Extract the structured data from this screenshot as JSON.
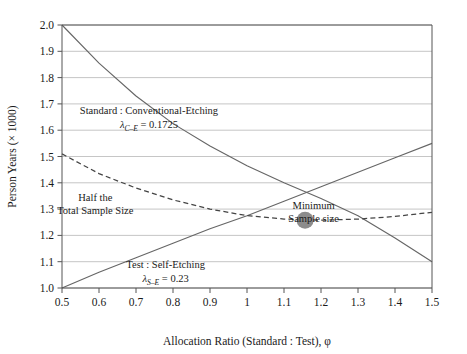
{
  "chart_data": {
    "type": "line",
    "title": "",
    "xlabel": "Allocation Ratio (Standard : Test), φ",
    "ylabel": "Person Years (× 1000)",
    "xlim": [
      0.5,
      1.5
    ],
    "ylim": [
      1.0,
      2.0
    ],
    "grid": true,
    "legend": "none (inline annotations)",
    "xticks": [
      "0.5",
      "0.6",
      "0.7",
      "0.8",
      "0.9",
      "1",
      "1.1",
      "1.2",
      "1.3",
      "1.4",
      "1.5"
    ],
    "yticks": [
      "1.0",
      "1.1",
      "1.2",
      "1.3",
      "1.4",
      "1.5",
      "1.6",
      "1.7",
      "1.8",
      "1.9",
      "2.0"
    ],
    "x": [
      0.5,
      0.6,
      0.7,
      0.8,
      0.9,
      1.0,
      1.1,
      1.2,
      1.3,
      1.4,
      1.5
    ],
    "series": [
      {
        "name": "Standard : Conventional-Etching",
        "style": "solid",
        "color": "#666666",
        "values": [
          2.0,
          1.855,
          1.73,
          1.625,
          1.54,
          1.465,
          1.4,
          1.34,
          1.275,
          1.19,
          1.1
        ]
      },
      {
        "name": "Test : Self-Etching",
        "style": "solid",
        "color": "#666666",
        "values": [
          1.0,
          1.06,
          1.115,
          1.17,
          1.225,
          1.275,
          1.33,
          1.385,
          1.44,
          1.495,
          1.55
        ]
      },
      {
        "name": "Half the Total Sample Size",
        "style": "dashed",
        "color": "#444444",
        "values": [
          1.51,
          1.435,
          1.38,
          1.335,
          1.3,
          1.275,
          1.262,
          1.258,
          1.262,
          1.272,
          1.288
        ]
      }
    ],
    "markers": [
      {
        "name": "Minimum Sample size",
        "x": 1.157,
        "y": 1.258,
        "color": "#8c8c8c",
        "shape": "circle",
        "radius": 8.5
      }
    ],
    "annotations": [
      {
        "name": "standard-conventional-etching",
        "line1": "Standard : Conventional-Etching",
        "lambda_symbol": "λ",
        "lambda_sub": "C–E",
        "lambda_eq": "= 0.1725",
        "x": 0.735,
        "y": 1.66
      },
      {
        "name": "half-total-sample-size",
        "line1": "Half the",
        "line2": "Total Sample Size",
        "x": 0.59,
        "y": 1.33
      },
      {
        "name": "minimum-sample-size",
        "line1": "Minimum",
        "line2": "Sample size",
        "x": 1.18,
        "y": 1.3
      },
      {
        "name": "test-self-etching",
        "line1": "Test : Self-Etching",
        "lambda_symbol": "λ",
        "lambda_sub": "S–E",
        "lambda_eq": "= 0.23",
        "x": 0.78,
        "y": 1.075
      }
    ],
    "colors": {
      "axis": "#555555",
      "grid": "#bfbfbf",
      "curve": "#666666",
      "dashed": "#444444",
      "marker": "#8c8c8c",
      "text": "#1a1a1a",
      "background": "#ffffff"
    }
  }
}
